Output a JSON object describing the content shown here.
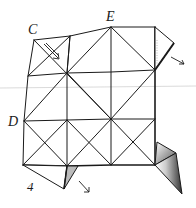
{
  "diagram": {
    "step_number": "4",
    "labels": {
      "C": "C",
      "E": "E",
      "D": "D"
    },
    "colors": {
      "ink": "#1a1a1a",
      "shade": "#777777",
      "guide": "#c8c8c8",
      "paper": "#ffffff"
    },
    "grid": {
      "rows": [
        [
          [
            34,
            40
          ],
          [
            70,
            36
          ],
          [
            111,
            27
          ],
          [
            155,
            27
          ]
        ],
        [
          [
            28,
            76
          ],
          [
            67,
            73
          ],
          [
            111,
            72
          ],
          [
            155,
            70
          ]
        ],
        [
          [
            24,
            121
          ],
          [
            67,
            120
          ],
          [
            111,
            119
          ],
          [
            155,
            119
          ]
        ],
        [
          [
            23,
            165
          ],
          [
            67,
            166
          ],
          [
            111,
            165
          ],
          [
            155,
            165
          ]
        ]
      ]
    },
    "flaps": {
      "right_top": [
        [
          155,
          27
        ],
        [
          174,
          43
        ],
        [
          155,
          70
        ]
      ],
      "bottom_right_upper": [
        [
          155,
          165
        ],
        [
          157,
          142
        ],
        [
          176,
          153
        ]
      ],
      "bottom_right_lower": [
        [
          155,
          165
        ],
        [
          176,
          153
        ],
        [
          182,
          194
        ]
      ],
      "bottom_left": [
        [
          23,
          165
        ],
        [
          64,
          189
        ],
        [
          78,
          166
        ]
      ]
    },
    "arrows": [
      {
        "name": "arrow-from-c",
        "from": [
          44,
          44
        ],
        "to": [
          58,
          58
        ]
      },
      {
        "name": "arrow-right-flap",
        "from": [
          172,
          57
        ],
        "to": [
          184,
          64
        ]
      },
      {
        "name": "arrow-bottom-flap",
        "from": [
          80,
          182
        ],
        "to": [
          88,
          192
        ]
      }
    ]
  }
}
